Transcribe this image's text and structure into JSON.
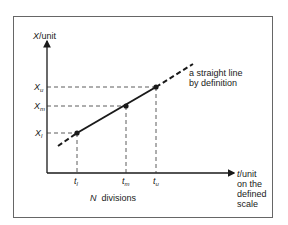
{
  "diagram": {
    "y_axis_label_var": "X",
    "y_axis_label_unit": "/unit",
    "x_axis_label_var": "t",
    "x_axis_label_unit": "/unit",
    "x_axis_label_extra": [
      "on the",
      "defined",
      "scale"
    ],
    "line_annotation": [
      "a straight line",
      "by definition"
    ],
    "divisions_var": "N",
    "divisions_text": "divisions",
    "y_ticks": [
      {
        "var": "X",
        "sub": "u"
      },
      {
        "var": "X",
        "sub": "m"
      },
      {
        "var": "X",
        "sub": "l"
      }
    ],
    "x_ticks": [
      {
        "var": "t",
        "sub": "l"
      },
      {
        "var": "t",
        "sub": "m"
      },
      {
        "var": "t",
        "sub": "u"
      }
    ],
    "colors": {
      "line": "#1a1a1a",
      "frame": "#555555",
      "background": "#ffffff"
    }
  }
}
